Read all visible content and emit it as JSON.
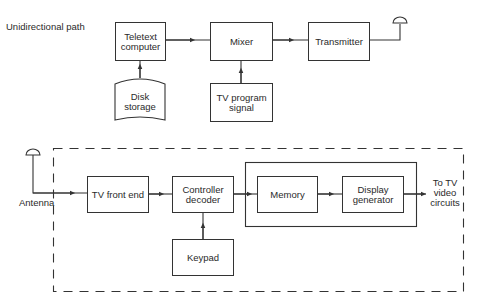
{
  "top_section": {
    "title": "Unidirectional path",
    "blocks": {
      "teletext_computer": "Teletext computer",
      "mixer": "Mixer",
      "transmitter": "Transmitter",
      "disk_storage": "Disk storage",
      "tv_program_signal": "TV program signal"
    }
  },
  "bottom_section": {
    "antenna_label": "Antenna",
    "blocks": {
      "tv_front_end": "TV front end",
      "controller_decoder": "Controller decoder",
      "memory": "Memory",
      "display_generator": "Display generator",
      "keypad": "Keypad"
    },
    "output_label": "To TV video circuits"
  },
  "colors": {
    "line": "#333333",
    "background": "#ffffff"
  }
}
